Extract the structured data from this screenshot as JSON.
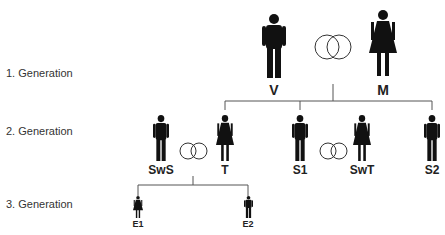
{
  "generations": [
    {
      "label": "1. Generation"
    },
    {
      "label": "2. Generation"
    },
    {
      "label": "3. Generation"
    }
  ],
  "people": {
    "V": {
      "label": "V",
      "sex": "male"
    },
    "M": {
      "label": "M",
      "sex": "female"
    },
    "SwS": {
      "label": "SwS",
      "sex": "male"
    },
    "T": {
      "label": "T",
      "sex": "female"
    },
    "S1": {
      "label": "S1",
      "sex": "male"
    },
    "SwT": {
      "label": "SwT",
      "sex": "female"
    },
    "S2": {
      "label": "S2",
      "sex": "male"
    },
    "E1": {
      "label": "E1",
      "sex": "female"
    },
    "E2": {
      "label": "E2",
      "sex": "male"
    }
  },
  "marriages": [
    {
      "partners": [
        "V",
        "M"
      ],
      "icon": "marriage-rings-icon"
    },
    {
      "partners": [
        "SwS",
        "T"
      ],
      "icon": "marriage-rings-icon"
    },
    {
      "partners": [
        "S1",
        "SwT"
      ],
      "icon": "marriage-rings-icon"
    }
  ],
  "colors": {
    "figure": "#111111",
    "line": "#555555"
  }
}
